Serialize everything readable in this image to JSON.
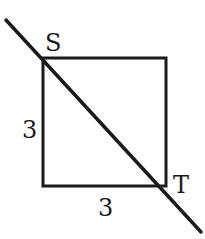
{
  "diagram": {
    "type": "geometry",
    "shape": "square",
    "side_length": 3,
    "vertices": {
      "top_left": "S",
      "bottom_right": "T"
    },
    "labels": {
      "vertex_s": "S",
      "vertex_t": "T",
      "left_side": "3",
      "bottom_side": "3"
    },
    "line": {
      "passes_through": [
        "S",
        "T"
      ],
      "extends_beyond": true
    },
    "colors": {
      "stroke": "#1a1a1a",
      "background": "#ffffff"
    }
  }
}
